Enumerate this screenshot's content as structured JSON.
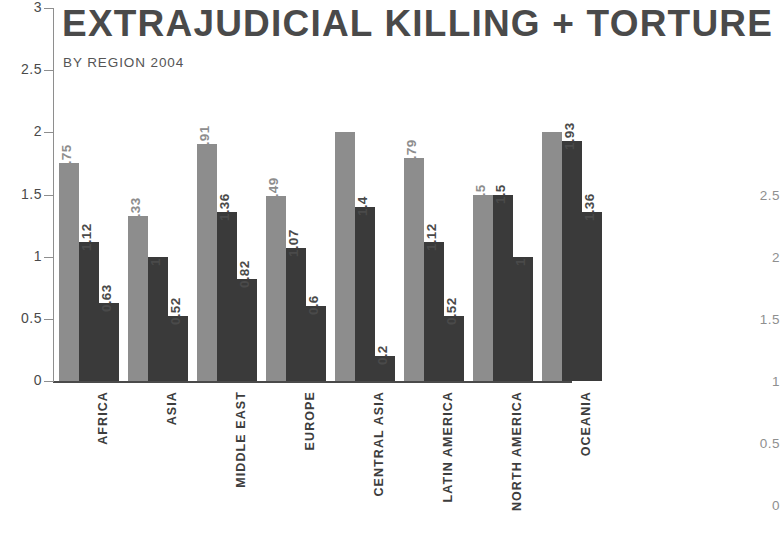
{
  "chart_data": {
    "type": "bar",
    "title": "EXTRAJUDICIAL KILLING + TORTURE",
    "subtitle": "BY REGION 2004",
    "xlabel": "",
    "ylabel": "",
    "ylim": [
      0,
      3
    ],
    "yticks": [
      "0",
      "0.5",
      "1",
      "1.5",
      "2",
      "2.5",
      "3"
    ],
    "grid": false,
    "legend": "none",
    "categories": [
      "AFRICA",
      "ASIA",
      "MIDDLE EAST",
      "EUROPE",
      "CENTRAL ASIA",
      "LATIN AMERICA",
      "NORTH AMERICA",
      "OCEANIA"
    ],
    "series": [
      {
        "name": "series-1",
        "color": "#8d8d8d",
        "values": [
          1.75,
          1.33,
          1.91,
          1.49,
          2,
          1.79,
          1.5,
          2
        ],
        "labels": [
          "1.75",
          "1.33",
          "1.91",
          "1.49",
          "2",
          "1.79",
          "1.5",
          "2"
        ]
      },
      {
        "name": "series-2",
        "color": "#3a3a3a",
        "values": [
          1.12,
          1,
          1.36,
          1.07,
          1.4,
          1.12,
          1.5,
          1.93
        ],
        "labels": [
          "1.12",
          "1",
          "1.36",
          "1.07",
          "1.4",
          "1.12",
          "1.5",
          "1.93"
        ]
      },
      {
        "name": "series-3",
        "color": "#3a3a3a",
        "values": [
          0.63,
          0.52,
          0.82,
          0.6,
          0.2,
          0.52,
          1,
          1.36
        ],
        "labels": [
          "0.63",
          "0.52",
          "0.82",
          "0.6",
          "0.2",
          "0.52",
          "1",
          "1.36"
        ]
      }
    ],
    "secondary_axis": {
      "position": "right",
      "ticks": [
        "2.5",
        "2",
        "1.5",
        "1",
        "0.5",
        "0"
      ]
    }
  }
}
